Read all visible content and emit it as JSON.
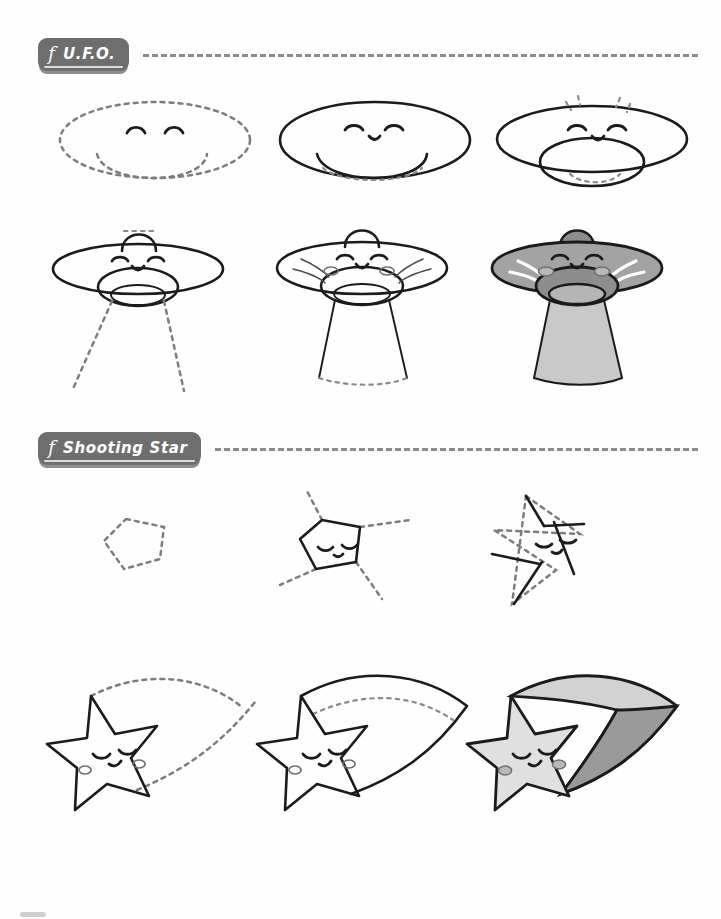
{
  "page": {
    "type": "drawing-tutorial-worksheet",
    "background_color": "#ffffff",
    "ink_color": "#1b1b1b",
    "guide_color": "#7d7d7d",
    "chip_color": "#6e6e6e",
    "fill_gray": "#9e9e9e",
    "fill_light_gray": "#cfcfcf",
    "fill_dark_gray": "#8a8a8a"
  },
  "sections": [
    {
      "id": "ufo",
      "glyph": "f",
      "title": "U.F.O.",
      "steps": [
        {
          "n": 1,
          "caption": "dotted ellipse body with dome and eyes"
        },
        {
          "n": 2,
          "caption": "inked saucer outline with dotted rim"
        },
        {
          "n": 3,
          "caption": "closed dome ring with antenna sparks"
        },
        {
          "n": 4,
          "caption": "top hat dome, inner ring, dashed beam"
        },
        {
          "n": 5,
          "caption": "shading lines, blush, inked beam"
        },
        {
          "n": 6,
          "caption": "colored gray saucer with light beam"
        }
      ]
    },
    {
      "id": "shooting-star",
      "glyph": "f",
      "title": "Shooting Star",
      "steps": [
        {
          "n": 1,
          "caption": "dotted pentagon"
        },
        {
          "n": 2,
          "caption": "inked pentagon with face and guide rays"
        },
        {
          "n": 3,
          "caption": "star points inked over guides"
        },
        {
          "n": 4,
          "caption": "finished star with dotted trail"
        },
        {
          "n": 5,
          "caption": "inked trail with dotted fold line"
        },
        {
          "n": 6,
          "caption": "colored star and two tone trail"
        }
      ]
    }
  ],
  "footer": {
    "mark": "page-corner-mark"
  }
}
